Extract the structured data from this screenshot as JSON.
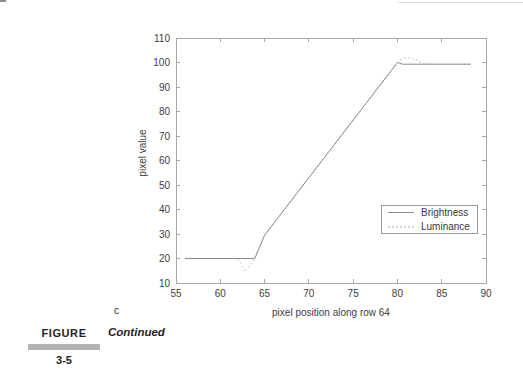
{
  "figure": {
    "subplot_label": "c",
    "caption_label": "FIGURE",
    "caption_number": "3-5",
    "caption_text": "Continued"
  },
  "chart_data": {
    "type": "line",
    "title": "",
    "xlabel": "pixel position along row 64",
    "ylabel": "pixel value",
    "xlim": [
      55,
      90
    ],
    "ylim": [
      10,
      110
    ],
    "x_ticks": [
      55,
      60,
      65,
      70,
      75,
      80,
      85,
      90
    ],
    "y_ticks": [
      10,
      20,
      30,
      40,
      50,
      60,
      70,
      80,
      90,
      100,
      110
    ],
    "grid": false,
    "legend": {
      "position": "inside-lower-right",
      "entries": [
        "Brightness",
        "Luminance"
      ]
    },
    "series": [
      {
        "name": "Brightness",
        "style": "solid",
        "color": "#8c8c8c",
        "points": [
          [
            56,
            20
          ],
          [
            63.9,
            20
          ],
          [
            65,
            29.5
          ],
          [
            80,
            100
          ],
          [
            80.6,
            99.3
          ],
          [
            88.3,
            99.3
          ]
        ]
      },
      {
        "name": "Luminance",
        "style": "dotted",
        "color": "#d4d4d4",
        "points": [
          [
            56,
            20
          ],
          [
            62,
            20
          ],
          [
            62.8,
            14.5
          ],
          [
            63.9,
            20
          ],
          [
            65,
            29.5
          ],
          [
            79.3,
            96.5
          ],
          [
            80.3,
            101
          ],
          [
            81,
            102.2
          ],
          [
            82,
            101.3
          ],
          [
            83,
            99.4
          ],
          [
            88.3,
            99.3
          ]
        ]
      }
    ]
  },
  "colors": {
    "axis": "#a6a6a6",
    "tick_text": "#3d3d3d",
    "legend_border": "#999999",
    "legend_text": "#3a3a3a",
    "caption_bar": "#b3b3b3",
    "caption_text": "#1f1f1f"
  }
}
